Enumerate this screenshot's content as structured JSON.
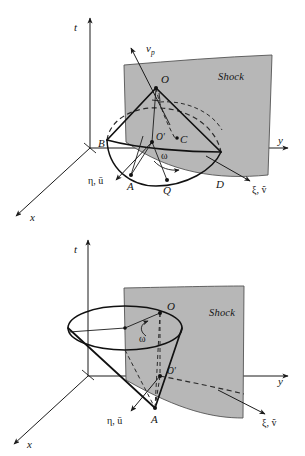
{
  "figure": {
    "background_color": "#ffffff",
    "shock_fill_color": "#b7b7b7",
    "line_color": "#141414",
    "panels": [
      {
        "id": "top",
        "name": "attached-shock-cone-panel",
        "axes": [
          {
            "name": "t-axis",
            "label": "t"
          },
          {
            "name": "y-axis",
            "label": "y"
          },
          {
            "name": "x-axis",
            "label": "x"
          },
          {
            "name": "eta-axis",
            "label": "η, ū"
          },
          {
            "name": "xi-axis",
            "label": "ξ, ṽ"
          }
        ],
        "surface_label": "Shock",
        "velocity_label": {
          "base": "v",
          "subscript": "p"
        },
        "angle_label": "ω",
        "points": [
          {
            "name": "point-O",
            "label": "O"
          },
          {
            "name": "point-O-prime",
            "label": "O'"
          },
          {
            "name": "point-C",
            "label": "C"
          },
          {
            "name": "point-B",
            "label": "B"
          },
          {
            "name": "point-A",
            "label": "A"
          },
          {
            "name": "point-Q",
            "label": "Q"
          },
          {
            "name": "point-D",
            "label": "D"
          }
        ]
      },
      {
        "id": "bottom",
        "name": "detached-shock-cone-panel",
        "axes": [
          {
            "name": "t-axis",
            "label": "t"
          },
          {
            "name": "y-axis",
            "label": "y"
          },
          {
            "name": "x-axis",
            "label": "x"
          },
          {
            "name": "eta-axis",
            "label": "η, ū"
          },
          {
            "name": "xi-axis",
            "label": "ξ, ṽ"
          }
        ],
        "surface_label": "Shock",
        "angle_label": "ω",
        "points": [
          {
            "name": "point-O",
            "label": "O"
          },
          {
            "name": "point-O-prime",
            "label": "O'"
          },
          {
            "name": "point-A",
            "label": "A"
          }
        ]
      }
    ]
  }
}
